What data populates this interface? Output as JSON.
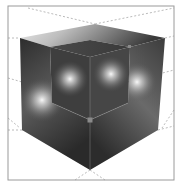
{
  "figure": {
    "colors": {
      "background": "#ffffff",
      "frame": "#9a9a9a",
      "guide_lines": "#a8a8a8",
      "face_dark": "#2a2a2a",
      "face_mid": "#5a5a5a",
      "highlight": "#f4f4f4",
      "vertex_marker": "#8a8a8a"
    },
    "frame": {
      "x": 8,
      "y": 6,
      "width": 166,
      "height": 174
    },
    "outer_cube": {
      "top_back": [
        95,
        24
      ],
      "top_left": [
        20,
        38
      ],
      "top_right": [
        165,
        38
      ],
      "bottom_left": [
        22,
        130
      ],
      "bottom_right": [
        158,
        130
      ],
      "bottom_front": [
        90,
        170
      ]
    },
    "inner_cutout": {
      "top_left": [
        50,
        47
      ],
      "top_center": [
        90,
        57
      ],
      "top_right": [
        130,
        47
      ],
      "bottom_left": [
        52,
        103
      ],
      "bottom_right": [
        128,
        103
      ],
      "bottom_front": [
        90,
        120
      ]
    },
    "highlights": [
      {
        "x": 70,
        "y": 79,
        "r": 18
      },
      {
        "x": 111,
        "y": 74,
        "r": 18
      },
      {
        "x": 42,
        "y": 100,
        "r": 22
      },
      {
        "x": 137,
        "y": 82,
        "r": 20
      }
    ]
  }
}
